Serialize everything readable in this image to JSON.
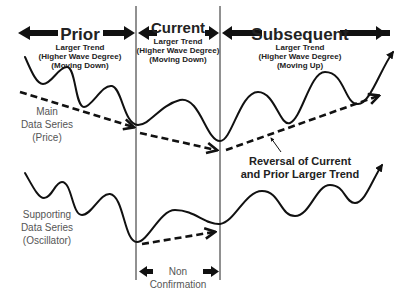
{
  "sections": [
    {
      "title": "Prior",
      "line1": "Larger Trend",
      "line2": "(Higher Wave Degree)",
      "line3": "(Moving Down)"
    },
    {
      "title": "Current",
      "line1": "Larger Trend",
      "line2": "(Higher Wave Degree)",
      "line3": "(Moving Down)"
    },
    {
      "title": "Subsequent",
      "line1": "Larger Trend",
      "line2": "(Higher Wave Degree)",
      "line3": "(Moving Up)"
    }
  ],
  "labels": {
    "main_series": [
      "Main",
      "Data Series",
      "(Price)"
    ],
    "supporting_series": [
      "Supporting",
      "Data Series",
      "(Oscillator)"
    ],
    "reversal": [
      "Reversal of Current",
      "and Prior Larger Trend"
    ],
    "non_confirmation": [
      "Non",
      "Confirmation"
    ]
  },
  "colors": {
    "ink": "#111111",
    "text_bold": "#222222",
    "text_regular": "#555555",
    "background": "#ffffff"
  }
}
